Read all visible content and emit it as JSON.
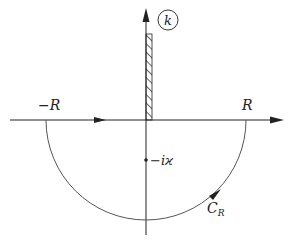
{
  "diagram": {
    "plane_label": "k",
    "labels": {
      "neg_R": "−R",
      "pos_R": "R",
      "pole": "−iϰ",
      "contour": "C",
      "contour_sub": "R"
    },
    "colors": {
      "stroke": "#222222",
      "arc": "#555555",
      "background": "#ffffff"
    }
  }
}
